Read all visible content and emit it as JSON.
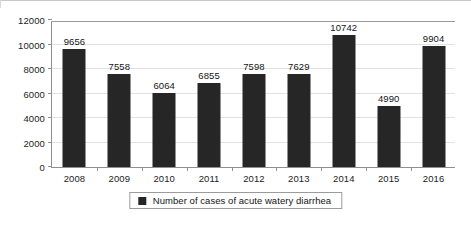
{
  "chart_data": {
    "type": "bar",
    "title": "",
    "subtitle": "",
    "xlabel": "",
    "ylabel": "",
    "categories": [
      "2008",
      "2009",
      "2010",
      "2011",
      "2012",
      "2013",
      "2014",
      "2015",
      "2016"
    ],
    "values": [
      9656,
      7558,
      6064,
      6855,
      7598,
      7629,
      10742,
      4990,
      9904
    ],
    "data_labels": [
      "9656",
      "7558",
      "6064",
      "6855",
      "7598",
      "7629",
      "10742",
      "4990",
      "9904"
    ],
    "series": [
      {
        "name": "Number of cases of acute watery diarrhea",
        "values": [
          9656,
          7558,
          6064,
          6855,
          7598,
          7629,
          10742,
          4990,
          9904
        ]
      }
    ],
    "ylim": [
      0,
      12000
    ],
    "ytick_step": 2000,
    "ytick_labels": [
      "0",
      "2000",
      "4000",
      "6000",
      "8000",
      "10000",
      "12000"
    ],
    "ytick_values": [
      0,
      2000,
      4000,
      6000,
      8000,
      10000,
      12000
    ],
    "grid": true,
    "grid_axis": "y",
    "legend_position": "bottom",
    "legend": {
      "label": "Number of cases of acute watery diarrhea",
      "swatch_icon": "square-marker-icon"
    },
    "colors": {
      "bar": "#262626",
      "background": "#ffffff",
      "gridline": "#e2e2e2",
      "axis": "#8f8f8f",
      "text": "#141414"
    }
  }
}
